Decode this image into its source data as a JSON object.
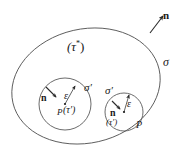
{
  "figure": {
    "kind": "math-diagram",
    "background_color": "#ffffff",
    "stroke_color": "#4a4a4a",
    "text_color": "#1a1a1a"
  },
  "outer_region": {
    "volume_label": "(τ",
    "volume_label_sup": "*",
    "volume_label_close": ")",
    "surface_label": "σ",
    "normal_label": "n"
  },
  "left_sphere": {
    "normal_label": "n",
    "radius_label": "ε",
    "surface_label": "σ′",
    "volume_label": "(τ′)",
    "point_label": "P"
  },
  "right_sphere": {
    "surface_label": "σ′",
    "normal_label": "n",
    "radius_label": "ε",
    "volume_label": "(τ′)",
    "point_label": "P"
  }
}
